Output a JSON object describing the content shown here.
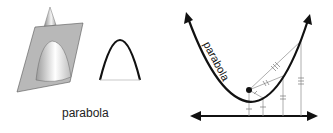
{
  "figure": {
    "left_panel": {
      "caption": "parabola",
      "elements": [
        "cone-sliced-by-plane",
        "parabola-curve-section"
      ]
    },
    "right_panel": {
      "curve_label": "parabola",
      "elements": [
        "parabola-curve",
        "focus-point",
        "directrix-line",
        "equal-distance-tick-marks"
      ]
    }
  },
  "colors": {
    "plane": "#b8b8b8",
    "curve": "#111111",
    "guide_lines": "#9a9a9a",
    "cone_light": "#ffffff",
    "cone_dark": "#9a9a9a"
  }
}
